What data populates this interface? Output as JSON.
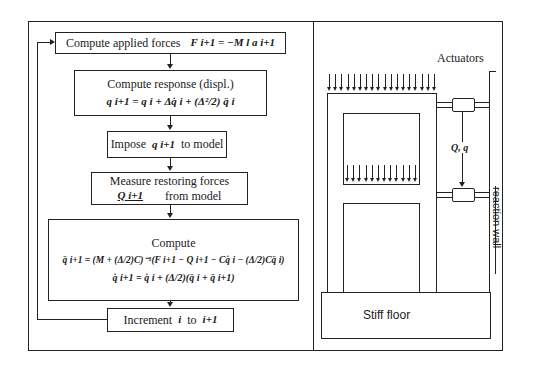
{
  "flowchart": {
    "steps": [
      {
        "id": "applied-forces",
        "label": "Compute applied forces",
        "equation": "F i+1 = −M l a i+1"
      },
      {
        "id": "response",
        "label": "Compute response (displ.)",
        "equation": "q i+1 = q i + Δq̇ i + (Δ²/2) q̈ i"
      },
      {
        "id": "impose",
        "label_pre": "Impose",
        "symbol": "q i+1",
        "label_post": "to model"
      },
      {
        "id": "measure",
        "label": "Measure restoring forces",
        "symbol": "Q i+1",
        "label_post": "from model"
      },
      {
        "id": "compute",
        "label": "Compute",
        "equation1": "q̈ i+1 = (M + (Δ/2)C)⁻¹(F i+1 − Q i+1 − Cq̇ i − (Δ/2)Cq̈ i)",
        "equation2": "q̇ i+1 = q̇ i + (Δ/2)(q̈ i + q̈ i+1)"
      },
      {
        "id": "increment",
        "label_pre": "Increment",
        "symbol_a": "i",
        "label_mid": "to",
        "symbol_b": "i+1"
      }
    ]
  },
  "setup": {
    "actuators_label": "Actuators",
    "signal_label": "Q, q",
    "wall_label": "reaction wall",
    "floor_label": "Stiff floor"
  }
}
